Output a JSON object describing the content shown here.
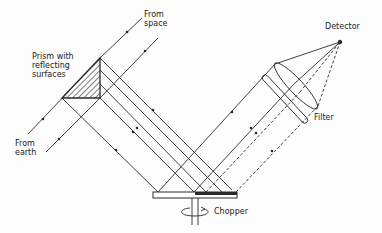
{
  "diagram": {
    "type": "optical-schematic",
    "labels": {
      "from_space_1": "From",
      "from_space_2": "space",
      "prism_1": "Prism with",
      "prism_2": "reflecting",
      "prism_3": "surfaces",
      "from_earth_1": "From",
      "from_earth_2": "earth",
      "detector": "Detector",
      "filter": "Filter",
      "chopper": "Chopper"
    },
    "colors": {
      "line": "#2a2a2a",
      "background": "#fdfdfd"
    }
  }
}
